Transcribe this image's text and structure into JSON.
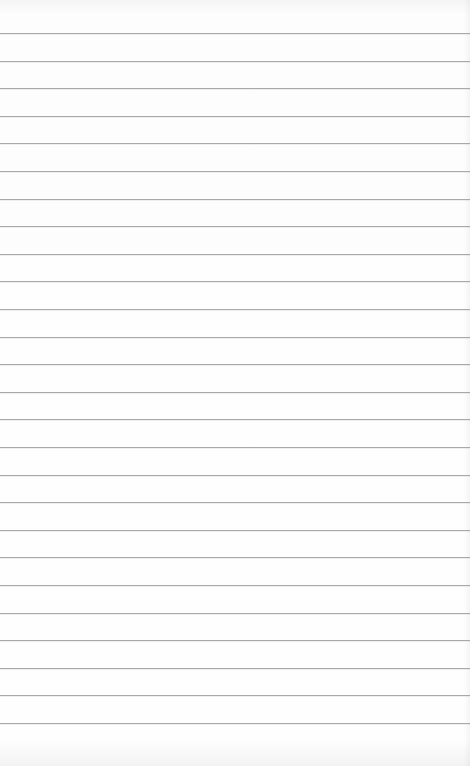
{
  "page": {
    "type": "lined-paper",
    "line_count": 26,
    "first_line_y": 33,
    "line_spacing": 27.6,
    "line_color": "#a9a9a9",
    "paper_color": "#fbfbfb"
  }
}
